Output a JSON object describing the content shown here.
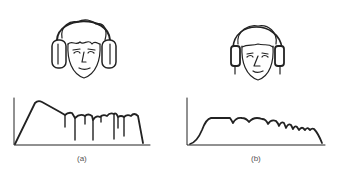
{
  "figure": {
    "panels": [
      {
        "id": "a",
        "label": "(a)",
        "illustration": "head-with-circumaural-headphones",
        "curve": "frequency response with sharp peak and deep notches"
      },
      {
        "id": "b",
        "label": "(b)",
        "illustration": "head-with-supra-aural-headphones",
        "curve": "flat-topped frequency response with shallow dips"
      }
    ],
    "colors": {
      "ink": "#222222",
      "background": "#ffffff"
    }
  }
}
